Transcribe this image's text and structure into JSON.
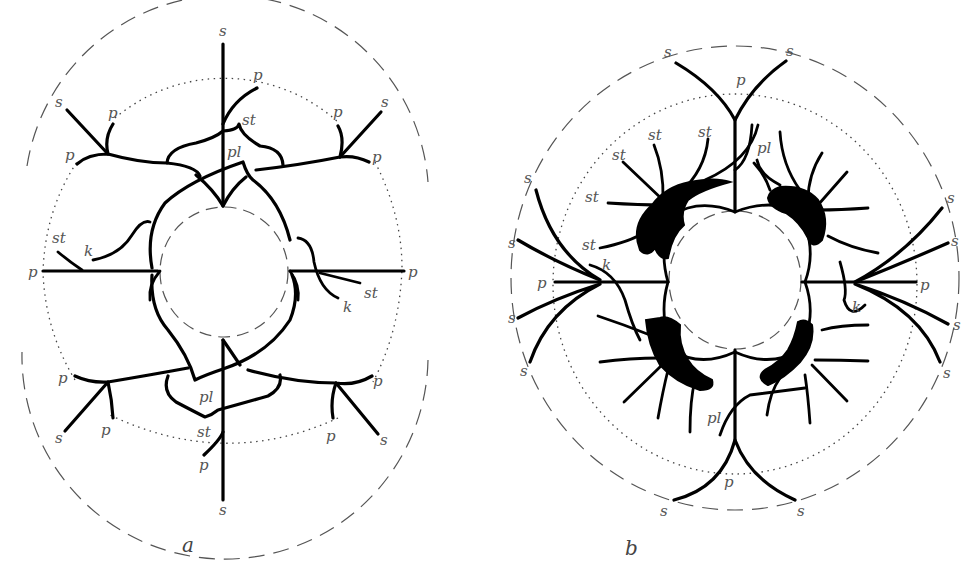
{
  "figure": {
    "panels": [
      {
        "id": "a",
        "caption": "a",
        "labels": {
          "s_top": "s",
          "s_bottom": "s",
          "s_upper_left": "s",
          "s_upper_right": "s",
          "s_lower_left": "s",
          "s_lower_right": "s",
          "p_top": "p",
          "p_bottom": "p",
          "p_upper_left_inner": "p",
          "p_upper_left_outer": "p",
          "p_upper_right_inner": "p",
          "p_upper_right_outer": "p",
          "p_lower_left_outer": "p",
          "p_lower_left_inner": "p",
          "p_lower_right_outer": "p",
          "p_lower_right_inner": "p",
          "p_left": "p",
          "p_right": "p",
          "st_top": "st",
          "st_bottom": "st",
          "st_left": "st",
          "st_right": "st",
          "pl_top": "pl",
          "pl_bottom": "pl",
          "k_left": "k",
          "k_right": "k"
        }
      },
      {
        "id": "b",
        "caption": "b",
        "labels": {
          "s_top_left": "s",
          "s_top_right": "s",
          "s_bottom_left": "s",
          "s_bottom_right": "s",
          "s_left_1": "s",
          "s_left_2": "s",
          "s_left_3": "s",
          "s_left_4": "s",
          "s_right_1": "s",
          "s_right_2": "s",
          "s_right_3": "s",
          "s_right_4": "s",
          "p_top": "p",
          "p_bottom": "p",
          "p_left": "p",
          "p_right": "p",
          "st_1": "st",
          "st_2": "st",
          "st_3": "st",
          "st_4": "st",
          "st_5": "st",
          "pl_top": "pl",
          "pl_bottom": "pl",
          "k_left": "k",
          "k_right": "k"
        }
      }
    ]
  }
}
